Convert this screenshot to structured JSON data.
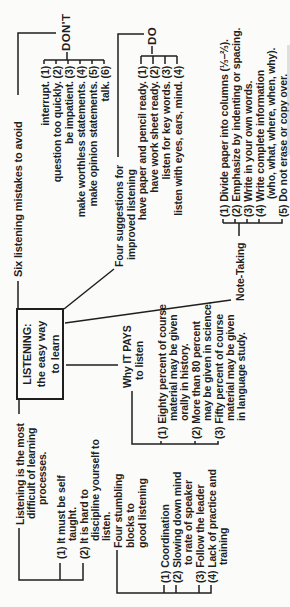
{
  "colors": {
    "ink": "#1f1f1f",
    "paper": "#fbfbfa"
  },
  "diagram": {
    "box": {
      "line1": "LISTENING:",
      "line2": "the easy way",
      "line3": "to learn"
    },
    "difficult": {
      "label1": "Listening is the most",
      "label2": "difficult of learning",
      "label3": "processes.",
      "item1_line1": "(1) It must be self",
      "item1_line2": "taught.",
      "item2_line1": "(2) It is hard to",
      "item2_line2": "discipline yourself to",
      "item2_line3": "listen."
    },
    "stumbling": {
      "label1": "Four stumbling",
      "label2": "blocks to",
      "label3": "good listening",
      "item1": "(1) Coordination",
      "item2_line1": "(2) Slowing down mind",
      "item2_line2": "to rate of speaker",
      "item3": "(3) Follow the leader",
      "item4_line1": "(4) Lack of practice and",
      "item4_line2": "training"
    },
    "mistakes": {
      "label": "Six listening mistakes to avoid",
      "tag": "DON'T",
      "item1": "interrupt. (1)",
      "item2": "question too quickly. (2)",
      "item3": "be impatient. (3)",
      "item4": "make worthless statements. (4)",
      "item5": "make opinion statements. (5)",
      "item6": "talk. (6)"
    },
    "suggestions": {
      "label1": "Four suggestions for",
      "label2": "improved listening",
      "tag": "DO",
      "item1": "have paper and pencil ready. (1)",
      "item2": "have work sheet ready. (2)",
      "item3": "listen for key words. (3)",
      "item4": "listen with eyes, ears, mind. (4)"
    },
    "pays": {
      "label1": "Why IT PAYS",
      "label2": "to listen",
      "item1_line1": "(1) Eighty percent of course",
      "item1_line2": "material may be given",
      "item1_line3": "orally in history.",
      "item2_line1": "(2) More than 80 percent",
      "item2_line2": "may be given in science.",
      "item3_line1": "(3) Fifty percent of course",
      "item3_line2": "material may be given",
      "item3_line3": "in language study."
    },
    "notetaking": {
      "label": "Note-Taking",
      "item1": "(1) Divide paper into columns (⅓–⅔).",
      "item2": "(2) Emphasize by indenting or spacing.",
      "item3": "(3) Write in your own words.",
      "item4_line1": "(4) Write complete information",
      "item4_line2": "(who, what, where, when, why).",
      "item5": "(5) Do not erase or copy over."
    }
  }
}
